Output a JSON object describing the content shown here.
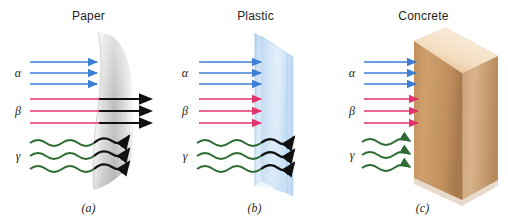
{
  "figure": {
    "background_color": "#ffffff",
    "width": 508,
    "height": 222
  },
  "colors": {
    "alpha": "#3d7fd4",
    "beta": "#e2336a",
    "gamma": "#2d6b33",
    "transmitted": "#111111",
    "paper": "#c9c9c9",
    "plastic": "#bcd9f2",
    "concrete_light": "#f0d3ad",
    "concrete_mid": "#c89767",
    "concrete_dark": "#b07f4f",
    "text": "#231f20"
  },
  "ray_labels": {
    "alpha": "α",
    "beta": "β",
    "gamma": "γ"
  },
  "panels": [
    {
      "id": "a",
      "title": "Paper",
      "caption": "(a)",
      "material": "paper",
      "rays": [
        {
          "type": "alpha",
          "label": "α",
          "count": 3,
          "blocked": true,
          "transmitted": false
        },
        {
          "type": "beta",
          "label": "β",
          "count": 3,
          "blocked": false,
          "transmitted": true
        },
        {
          "type": "gamma",
          "label": "γ",
          "count": 3,
          "blocked": false,
          "transmitted": true
        }
      ]
    },
    {
      "id": "b",
      "title": "Plastic",
      "caption": "(b)",
      "material": "plastic",
      "rays": [
        {
          "type": "alpha",
          "label": "α",
          "count": 3,
          "blocked": true,
          "transmitted": false
        },
        {
          "type": "beta",
          "label": "β",
          "count": 3,
          "blocked": true,
          "transmitted": false
        },
        {
          "type": "gamma",
          "label": "γ",
          "count": 3,
          "blocked": false,
          "transmitted": true
        }
      ]
    },
    {
      "id": "c",
      "title": "Concrete",
      "caption": "(c)",
      "material": "concrete",
      "rays": [
        {
          "type": "alpha",
          "label": "α",
          "count": 3,
          "blocked": true,
          "transmitted": false
        },
        {
          "type": "beta",
          "label": "β",
          "count": 3,
          "blocked": true,
          "transmitted": false
        },
        {
          "type": "gamma",
          "label": "γ",
          "count": 3,
          "blocked": true,
          "transmitted": false
        }
      ]
    }
  ]
}
